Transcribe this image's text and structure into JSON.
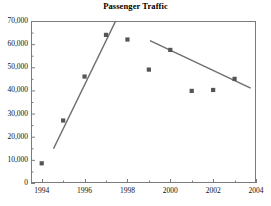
{
  "chart_data": {
    "type": "scatter",
    "title": "Passenger Traffic",
    "xlabel": "",
    "ylabel": "",
    "grid": false,
    "legend": "none",
    "xlim": [
      1993.5,
      2004
    ],
    "ylim": [
      0,
      70000
    ],
    "x_ticks_major": [
      1994,
      1996,
      1998,
      2000,
      2002,
      2004
    ],
    "x_tick_labels": [
      "1994",
      "1996",
      "1998",
      "2000",
      "2002",
      "2004"
    ],
    "x_ticks_minor": [
      1995,
      1997,
      1999,
      2001,
      2003
    ],
    "y_ticks_major": [
      0,
      10000,
      20000,
      30000,
      40000,
      50000,
      60000,
      70000
    ],
    "y_tick_labels": [
      "0",
      "10,000",
      "20,000",
      "30,000",
      "40,000",
      "50,000",
      "60,000",
      "70,000"
    ],
    "y_ticks_minor": [
      5000,
      15000,
      25000,
      35000,
      45000,
      55000,
      65000
    ],
    "marker_color": "#555555",
    "line_color": "#6f6f6f",
    "axis_color": "#7b7b7b",
    "series": [
      {
        "name": "Passengers",
        "x": [
          1994,
          1995,
          1996,
          1997,
          1998,
          1999,
          2000,
          2001,
          2002,
          2003
        ],
        "values": [
          8500,
          27000,
          46000,
          64000,
          62000,
          49000,
          57500,
          39800,
          40200,
          45000
        ]
      }
    ],
    "trend_lines": [
      {
        "name": "growth-trend",
        "x": [
          1994.55,
          1997.45
        ],
        "y": [
          14800,
          70000
        ]
      },
      {
        "name": "decline-trend",
        "x": [
          1999.05,
          2003.75
        ],
        "y": [
          61500,
          41000
        ]
      }
    ]
  }
}
